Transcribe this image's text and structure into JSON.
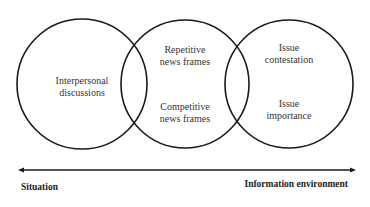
{
  "diagram": {
    "type": "venn-three-circles",
    "circles": [
      {
        "id": "left",
        "lines": [
          "Interpersonal",
          "discussions"
        ]
      },
      {
        "id": "middle",
        "top_lines": [
          "Repetitive",
          "news frames"
        ],
        "bottom_lines": [
          "Competitive",
          "news frames"
        ]
      },
      {
        "id": "right",
        "top_lines": [
          "Issue",
          "contestation"
        ],
        "bottom_lines": [
          "Issue",
          "importance"
        ]
      }
    ],
    "axis": {
      "left_label": "Situation",
      "right_label": "Information environment",
      "arrow": "double-headed"
    },
    "colors": {
      "stroke": "#1a1a1a",
      "text": "#333333",
      "background": "#ffffff"
    }
  }
}
